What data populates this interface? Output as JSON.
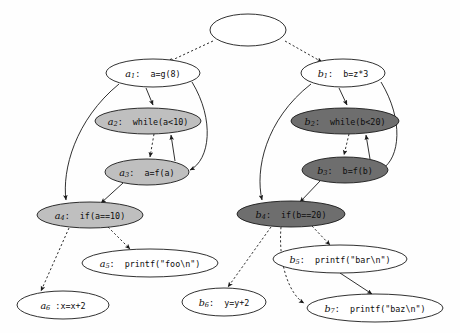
{
  "figure": {
    "type": "program-dependence-graph",
    "background_color": "#fefefe",
    "stroke_color": "#1a1a1a",
    "node_fills": {
      "white": "#ffffff",
      "light_gray": "#bfbfbf",
      "dark_gray": "#6e6e6e"
    }
  },
  "nodes": [
    {
      "id": "root",
      "name": "entry-node",
      "label_id": "",
      "sub": "",
      "code": "",
      "fill": "white",
      "cx": 248,
      "cy": 30,
      "rx": 38,
      "ry": 16
    },
    {
      "id": "a1",
      "name": "node-a1",
      "label_id": "a",
      "sub": "1",
      "code": "a=g(8)",
      "fill": "white",
      "cx": 153,
      "cy": 73,
      "rx": 47,
      "ry": 14
    },
    {
      "id": "a2",
      "name": "node-a2",
      "label_id": "a",
      "sub": "2",
      "code": "while(a<10)",
      "fill": "light",
      "cx": 148,
      "cy": 121,
      "rx": 53,
      "ry": 13
    },
    {
      "id": "a3",
      "name": "node-a3",
      "label_id": "a",
      "sub": "3",
      "code": "a=f(a)",
      "fill": "light",
      "cx": 147,
      "cy": 172,
      "rx": 42,
      "ry": 13
    },
    {
      "id": "a4",
      "name": "node-a4",
      "label_id": "a",
      "sub": "4",
      "code": "if(a==10)",
      "fill": "light",
      "cx": 90,
      "cy": 215,
      "rx": 53,
      "ry": 13
    },
    {
      "id": "a5",
      "name": "node-a5",
      "label_id": "a",
      "sub": "5",
      "code": "printf(\"foo\\n\")",
      "fill": "white",
      "cx": 150,
      "cy": 263,
      "rx": 68,
      "ry": 14
    },
    {
      "id": "a6",
      "name": "node-a6",
      "label_id": "a",
      "sub": "6",
      "code": ":x=x+2",
      "fill": "white",
      "cx": 63,
      "cy": 305,
      "rx": 46,
      "ry": 14,
      "tight": true
    },
    {
      "id": "b1",
      "name": "node-b1",
      "label_id": "b",
      "sub": "1",
      "code": "b=z*3",
      "fill": "white",
      "cx": 343,
      "cy": 73,
      "rx": 42,
      "ry": 14
    },
    {
      "id": "b2",
      "name": "node-b2",
      "label_id": "b",
      "sub": "2",
      "code": "while(b<20)",
      "fill": "dark",
      "cx": 345,
      "cy": 121,
      "rx": 54,
      "ry": 13
    },
    {
      "id": "b3",
      "name": "node-b3",
      "label_id": "b",
      "sub": "3",
      "code": "b=f(b)",
      "fill": "dark",
      "cx": 345,
      "cy": 170,
      "rx": 43,
      "ry": 13
    },
    {
      "id": "b4",
      "name": "node-b4",
      "label_id": "b",
      "sub": "4",
      "code": "if(b==20)",
      "fill": "dark",
      "cx": 291,
      "cy": 214,
      "rx": 54,
      "ry": 13
    },
    {
      "id": "b5",
      "name": "node-b5",
      "label_id": "b",
      "sub": "5",
      "code": "printf(\"bar\\n\")",
      "fill": "white",
      "cx": 340,
      "cy": 259,
      "rx": 67,
      "ry": 14
    },
    {
      "id": "b6",
      "name": "node-b6",
      "label_id": "b",
      "sub": "6",
      "code": "y=y+2",
      "fill": "white",
      "cx": 224,
      "cy": 302,
      "rx": 42,
      "ry": 14
    },
    {
      "id": "b7",
      "name": "node-b7",
      "label_id": "b",
      "sub": "7",
      "code": "printf(\"baz\\n\")",
      "fill": "white",
      "cx": 375,
      "cy": 308,
      "rx": 68,
      "ry": 14
    }
  ],
  "edges": [
    {
      "name": "edge-root-a1",
      "from": "root",
      "to": "a1",
      "style": "dashed",
      "d": "M 213,41 L 168,62",
      "arrow": true
    },
    {
      "name": "edge-root-b1",
      "from": "root",
      "to": "b1",
      "style": "dashed",
      "d": "M 285,41 L 322,62",
      "arrow": true
    },
    {
      "name": "edge-a1-a2",
      "from": "a1",
      "to": "a2",
      "style": "solid",
      "d": "M 146,88 L 153,105",
      "arrow": true
    },
    {
      "name": "edge-a1-a4",
      "from": "a1",
      "to": "a4",
      "style": "solid",
      "d": "M 119,84 C 75,120 62,170 66,200",
      "arrow": true
    },
    {
      "name": "edge-a1-a3",
      "from": "a1",
      "to": "a3",
      "style": "solid",
      "d": "M 192,82 C 215,120 210,160 190,170",
      "arrow": true
    },
    {
      "name": "edge-a2-a3",
      "from": "a2",
      "to": "a3",
      "style": "dashed",
      "d": "M 154,134 L 150,157",
      "arrow": true
    },
    {
      "name": "edge-a3-a2",
      "from": "a3",
      "to": "a2",
      "style": "solid",
      "d": "M 175,161 L 171,135",
      "arrow": true
    },
    {
      "name": "edge-a3-a4",
      "from": "a3",
      "to": "a4",
      "style": "solid",
      "d": "M 123,183 L 101,203",
      "arrow": true
    },
    {
      "name": "edge-a4-a5",
      "from": "a4",
      "to": "a5",
      "style": "dashed",
      "d": "M 108,227 L 130,249",
      "arrow": true
    },
    {
      "name": "edge-a4-a6",
      "from": "a4",
      "to": "a6",
      "style": "dashed",
      "d": "M 69,228 L 41,291",
      "arrow": true
    },
    {
      "name": "edge-b1-b2",
      "from": "b1",
      "to": "b2",
      "style": "solid",
      "d": "M 339,88 L 347,105",
      "arrow": true
    },
    {
      "name": "edge-b1-b4",
      "from": "b1",
      "to": "b4",
      "style": "solid",
      "d": "M 311,84 C 265,120 255,170 262,200",
      "arrow": true
    },
    {
      "name": "edge-b1-b3",
      "from": "b1",
      "to": "b3",
      "style": "solid",
      "d": "M 381,82 C 404,120 400,158 382,169",
      "arrow": true
    },
    {
      "name": "edge-b2-b3",
      "from": "b2",
      "to": "b3",
      "style": "dashed",
      "d": "M 349,134 L 344,155",
      "arrow": true
    },
    {
      "name": "edge-b3-b2",
      "from": "b3",
      "to": "b2",
      "style": "solid",
      "d": "M 370,159 L 366,135",
      "arrow": true
    },
    {
      "name": "edge-b3-b4",
      "from": "b3",
      "to": "b4",
      "style": "solid",
      "d": "M 320,181 L 300,202",
      "arrow": true
    },
    {
      "name": "edge-b4-b5",
      "from": "b4",
      "to": "b5",
      "style": "dashed",
      "d": "M 312,226 L 330,245",
      "arrow": true
    },
    {
      "name": "edge-b4-b6",
      "from": "b4",
      "to": "b6",
      "style": "dashed",
      "d": "M 271,227 L 228,287",
      "arrow": true
    },
    {
      "name": "edge-b4-b7",
      "from": "b4",
      "to": "b7",
      "style": "dashed",
      "d": "M 281,227 C 278,265 290,295 304,303",
      "arrow": true
    },
    {
      "name": "edge-b5-b7",
      "from": "b5",
      "to": "b7",
      "style": "solid",
      "d": "M 340,273 L 372,294",
      "arrow": true
    }
  ]
}
